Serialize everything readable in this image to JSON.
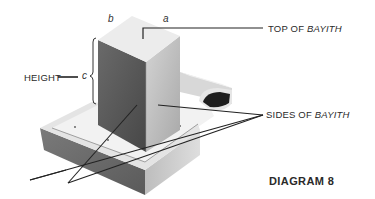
{
  "diagram": {
    "title": "DIAGRAM 8",
    "labels": {
      "top": {
        "prefix": "TOP OF ",
        "emphasis": "BAYITH"
      },
      "sides": {
        "prefix": "SIDES OF ",
        "emphasis": "BAYITH"
      },
      "height": "HEIGHT"
    },
    "variables": {
      "a": "a",
      "b": "b",
      "c": "c"
    },
    "colors": {
      "ink": "#2a2a2a",
      "top_face": "#e8e8e8",
      "dark_face": "#555555",
      "light_face": "#bdbdbd",
      "base_dark": "#6e6e6e",
      "base_light": "#cfcfcf",
      "rim": "#f2f2f2",
      "hollow": "#1e1e1e"
    }
  }
}
